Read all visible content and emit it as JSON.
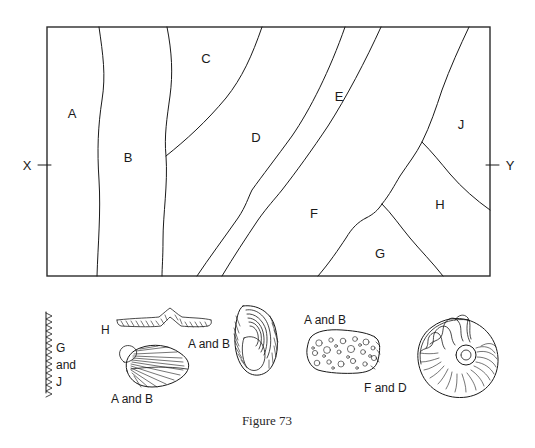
{
  "figure": {
    "caption": "Figure 73",
    "cross_section_labels": {
      "left_end": "X",
      "right_end": "Y"
    },
    "map_units": [
      {
        "id": "A",
        "label": "A",
        "x": 72,
        "y": 113
      },
      {
        "id": "B",
        "label": "B",
        "x": 128,
        "y": 157
      },
      {
        "id": "C",
        "label": "C",
        "x": 206,
        "y": 58
      },
      {
        "id": "D",
        "label": "D",
        "x": 256,
        "y": 137
      },
      {
        "id": "E",
        "label": "E",
        "x": 339,
        "y": 96
      },
      {
        "id": "F",
        "label": "F",
        "x": 314,
        "y": 213
      },
      {
        "id": "G",
        "label": "G",
        "x": 380,
        "y": 253
      },
      {
        "id": "H",
        "label": "H",
        "x": 440,
        "y": 204
      },
      {
        "id": "J",
        "label": "J",
        "x": 461,
        "y": 124
      }
    ],
    "fossils": [
      {
        "name": "graptolite-serrated-stipe",
        "label_lines": [
          "G",
          "and",
          "J"
        ],
        "label_text": "G and J"
      },
      {
        "name": "graptolite-zigzag-stipe",
        "label_lines": [
          "H"
        ],
        "label_text": "H"
      },
      {
        "name": "brachiopod-radial-ribbed-shell",
        "label_lines": [
          "A  and  B"
        ],
        "label_text": "A and B"
      },
      {
        "name": "brachiopod-concentric-shell",
        "label_lines": [
          "A and B"
        ],
        "label_text": "A and B"
      },
      {
        "name": "coral-porous-colony",
        "label_lines": [
          "A and B"
        ],
        "label_text": "A and B"
      },
      {
        "name": "ammonite-coiled-shell",
        "label_lines": [
          "F and D"
        ],
        "label_text": "F and D"
      }
    ]
  },
  "colors": {
    "ink": "#1a1a1a",
    "frame": "#2b2b2b",
    "background": "#ffffff"
  }
}
